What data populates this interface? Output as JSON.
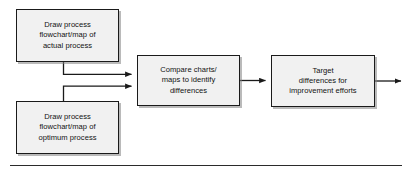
{
  "diagram": {
    "type": "process-flowchart",
    "orientation": "left-to-right",
    "nodes": [
      {
        "id": "actual",
        "name": "draw-actual-process-box",
        "label": "Draw process\nflowchart/map of\nactual process",
        "shape": "rectangle",
        "fill": "#f1f1f1",
        "border": "#1a1a1a"
      },
      {
        "id": "optimum",
        "name": "draw-optimum-process-box",
        "label": "Draw process\nflowchart/map of\noptimum process",
        "shape": "rectangle",
        "fill": "#f1f1f1",
        "border": "#1a1a1a"
      },
      {
        "id": "compare",
        "name": "compare-charts-box",
        "label": "Compare charts/\nmaps to identify\ndifferences",
        "shape": "rectangle",
        "fill": "#f1f1f1",
        "border": "#1a1a1a"
      },
      {
        "id": "target",
        "name": "target-differences-box",
        "label": "Target\ndifferences for\nimprovement efforts",
        "shape": "rectangle",
        "fill": "#f1f1f1",
        "border": "#1a1a1a"
      }
    ],
    "connectors": [
      {
        "id": "actual-to-compare",
        "from": "actual",
        "to": "compare",
        "style": "elbow",
        "arrowhead": "filled-triangle"
      },
      {
        "id": "optimum-to-compare",
        "from": "optimum",
        "to": "compare",
        "style": "elbow",
        "arrowhead": "filled-triangle"
      },
      {
        "id": "compare-to-target",
        "from": "compare",
        "to": "target",
        "style": "straight",
        "arrowhead": "filled-triangle"
      },
      {
        "id": "target-to-exit",
        "from": "target",
        "to": "exit",
        "style": "straight",
        "arrowhead": "filled-triangle"
      }
    ],
    "line_color": "#1a1a1a",
    "footer_rule": true
  }
}
